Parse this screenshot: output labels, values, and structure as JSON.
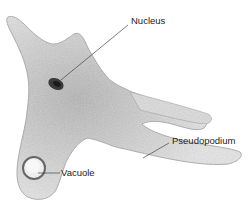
{
  "diagram": {
    "labels": {
      "nucleus": "Nucleus",
      "pseudopodium": "Pseudopodium",
      "vacuole": "Vacuole"
    },
    "colors": {
      "body_fill": "#d9d9d9",
      "body_stroke": "#9a9a9a",
      "nucleus": "#2a2a2a",
      "leader_line": "#444444",
      "label_text": "#222222"
    }
  }
}
